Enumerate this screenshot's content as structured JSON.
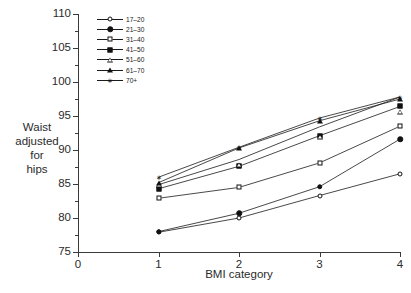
{
  "chart_data": {
    "type": "line",
    "title": "",
    "subtitle": "",
    "xlabel": "BMI category",
    "ylabel": "Waist adjusted for hips",
    "ylabel_lines": [
      "Waist",
      "adjusted",
      "for",
      "hips"
    ],
    "x": [
      1,
      2,
      3,
      4
    ],
    "xlim": [
      0,
      4
    ],
    "ylim": [
      75,
      110
    ],
    "xticks": [
      "0",
      "1",
      "2",
      "3",
      "4"
    ],
    "yticks": [
      "75",
      "80",
      "85",
      "90",
      "95",
      "100",
      "105",
      "110"
    ],
    "ytick_step": 5,
    "yminor_step": 2.5,
    "grid": false,
    "legend_position": "top-left-inside",
    "legend_title": "",
    "series": [
      {
        "name": "17–20",
        "marker": "circle-open",
        "values": [
          77.9,
          80.0,
          83.3,
          86.5
        ]
      },
      {
        "name": "21–30",
        "marker": "circle-fill",
        "values": [
          78.0,
          80.7,
          84.6,
          91.6
        ]
      },
      {
        "name": "31–40",
        "marker": "square-open",
        "values": [
          82.9,
          84.5,
          88.1,
          93.5
        ]
      },
      {
        "name": "41–50",
        "marker": "square-fill",
        "values": [
          84.3,
          87.6,
          92.1,
          96.4
        ]
      },
      {
        "name": "51–60",
        "marker": "triangle-open",
        "values": [
          84.9,
          88.6,
          93.4,
          97.8
        ]
      },
      {
        "name": "61–70",
        "marker": "triangle-fill",
        "values": [
          85.2,
          90.3,
          94.3,
          97.5
        ]
      },
      {
        "name": "70+",
        "marker": "star",
        "values": [
          86.0,
          90.4,
          94.7,
          97.8
        ]
      }
    ],
    "line_color": "#1a1a1a",
    "axis_color": "#3a3a3a",
    "background_color": "#ffffff"
  }
}
